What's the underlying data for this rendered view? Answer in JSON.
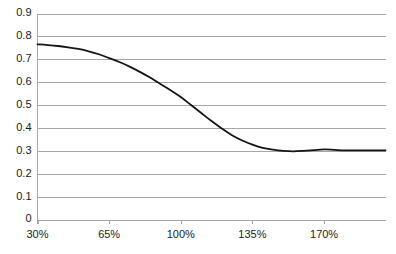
{
  "chart_data": {
    "type": "line",
    "title": "",
    "subtitle": "",
    "xlabel": "",
    "ylabel": "",
    "grid": "horizontal",
    "legend": "none",
    "xlim": [
      30,
      200
    ],
    "ylim": [
      0,
      0.9
    ],
    "x_tick_labels": [
      "30%",
      "65%",
      "100%",
      "135%",
      "170%"
    ],
    "x_tick_values": [
      30,
      65,
      100,
      135,
      170
    ],
    "y_tick_labels": [
      "0",
      "0.1",
      "0.2",
      "0.3",
      "0.4",
      "0.5",
      "0.6",
      "0.7",
      "0.8",
      "0.9"
    ],
    "y_tick_values": [
      0,
      0.1,
      0.2,
      0.3,
      0.4,
      0.5,
      0.6,
      0.7,
      0.8,
      0.9
    ],
    "series": [
      {
        "name": "series-1",
        "color": "#141414",
        "x": [
          30,
          35,
          40,
          45,
          50,
          55,
          60,
          65,
          70,
          75,
          80,
          85,
          90,
          95,
          100,
          105,
          110,
          115,
          120,
          125,
          130,
          135,
          140,
          145,
          150,
          155,
          160,
          165,
          170,
          175,
          180,
          185,
          190,
          195,
          200
        ],
        "values": [
          0.765,
          0.762,
          0.758,
          0.752,
          0.745,
          0.735,
          0.722,
          0.705,
          0.688,
          0.668,
          0.645,
          0.62,
          0.592,
          0.565,
          0.535,
          0.5,
          0.465,
          0.43,
          0.398,
          0.368,
          0.345,
          0.327,
          0.313,
          0.305,
          0.3,
          0.298,
          0.3,
          0.303,
          0.306,
          0.304,
          0.302,
          0.302,
          0.302,
          0.302,
          0.302
        ]
      }
    ]
  },
  "axes": {
    "gridline_color": "#a6a6a6",
    "spine_color": "#a6a6a6",
    "label_color": "#1a1a1a"
  }
}
